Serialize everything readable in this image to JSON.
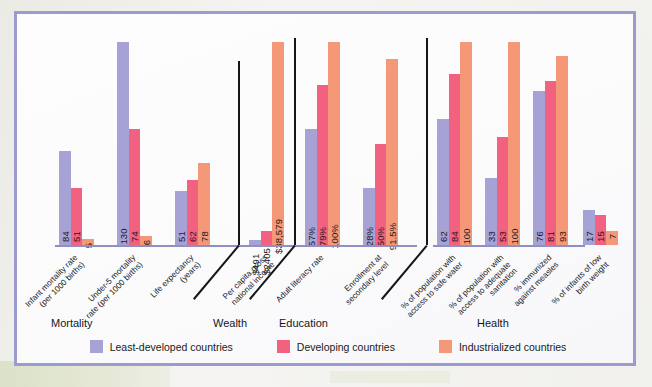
{
  "frame": {
    "border_color": "#9c9bd0",
    "background": "#fcfcfd"
  },
  "legend": {
    "items": [
      {
        "label": "Least-developed countries",
        "color": "#a6a2d6"
      },
      {
        "label": "Developing countries",
        "color": "#f2617f"
      },
      {
        "label": "Industrialized countries",
        "color": "#f59877"
      }
    ]
  },
  "sections": [
    {
      "label": "Mortality"
    },
    {
      "label": "Wealth"
    },
    {
      "label": "Education"
    },
    {
      "label": "Health"
    }
  ],
  "chart_data": {
    "type": "bar",
    "title": "",
    "xlabel": "",
    "ylabel": "",
    "grid": false,
    "legend_position": "bottom",
    "series": [
      {
        "name": "Least-developed countries",
        "color": "#a6a2d6"
      },
      {
        "name": "Developing countries",
        "color": "#f2617f"
      },
      {
        "name": "Industrialized countries",
        "color": "#f59877"
      }
    ],
    "groups": [
      {
        "section": "Mortality",
        "category": "Infant mortality rate (per 1000 births)",
        "category_lines": [
          "Infant mortality rate",
          "(per 1000 births)"
        ],
        "values": [
          84,
          51,
          5
        ],
        "labels": [
          "84",
          "51",
          "5"
        ]
      },
      {
        "section": "Mortality",
        "category": "Under-5 mortality rate (per 1000 births)",
        "category_lines": [
          "Under-5 mortality",
          "rate (per 1000 births)"
        ],
        "values": [
          130,
          74,
          6
        ],
        "labels": [
          "130",
          "74",
          "6"
        ]
      },
      {
        "section": "Mortality",
        "category": "Life expectancy (years)",
        "category_lines": [
          "Life expectancy",
          "(years)"
        ],
        "values": [
          51,
          62,
          78
        ],
        "labels": [
          "51",
          "62",
          "78"
        ]
      },
      {
        "section": "Wealth",
        "category": "Per capita gross national income",
        "category_lines": [
          "Per capita gross",
          "national income"
        ],
        "values": [
          491,
          2405,
          38579
        ],
        "labels": [
          "$491",
          "$2405",
          "$38,579"
        ]
      },
      {
        "section": "Education",
        "category": "Adult literacy rate",
        "category_lines": [
          "Adult literacy rate"
        ],
        "values": [
          57,
          79,
          100
        ],
        "labels": [
          "57%",
          "79%",
          "100%"
        ]
      },
      {
        "section": "Education",
        "category": "Enrollment at secondary level",
        "category_lines": [
          "Enrollment at",
          "secondary level"
        ],
        "values": [
          28,
          50,
          91.5
        ],
        "labels": [
          "28%",
          "50%",
          "91.5%"
        ]
      },
      {
        "section": "Health",
        "category": "% of population with access to safe water",
        "category_lines": [
          "% of population with",
          "access to safe water"
        ],
        "values": [
          62,
          84,
          100
        ],
        "labels": [
          "62",
          "84",
          "100"
        ]
      },
      {
        "section": "Health",
        "category": "% of population with access to adequate sanitation",
        "category_lines": [
          "% of population with",
          "access to adequate",
          "sanitation"
        ],
        "values": [
          33,
          53,
          100
        ],
        "labels": [
          "33",
          "53",
          "100"
        ]
      },
      {
        "section": "Health",
        "category": "% immunized against measles",
        "category_lines": [
          "% immunized",
          "against measles"
        ],
        "values": [
          76,
          81,
          93
        ],
        "labels": [
          "76",
          "81",
          "93"
        ]
      },
      {
        "section": "Health",
        "category": "% of infants of low birth weight",
        "category_lines": [
          "% of infants of low",
          "birth weight"
        ],
        "values": [
          17,
          15,
          7
        ],
        "labels": [
          "17",
          "15",
          "7"
        ]
      }
    ]
  }
}
